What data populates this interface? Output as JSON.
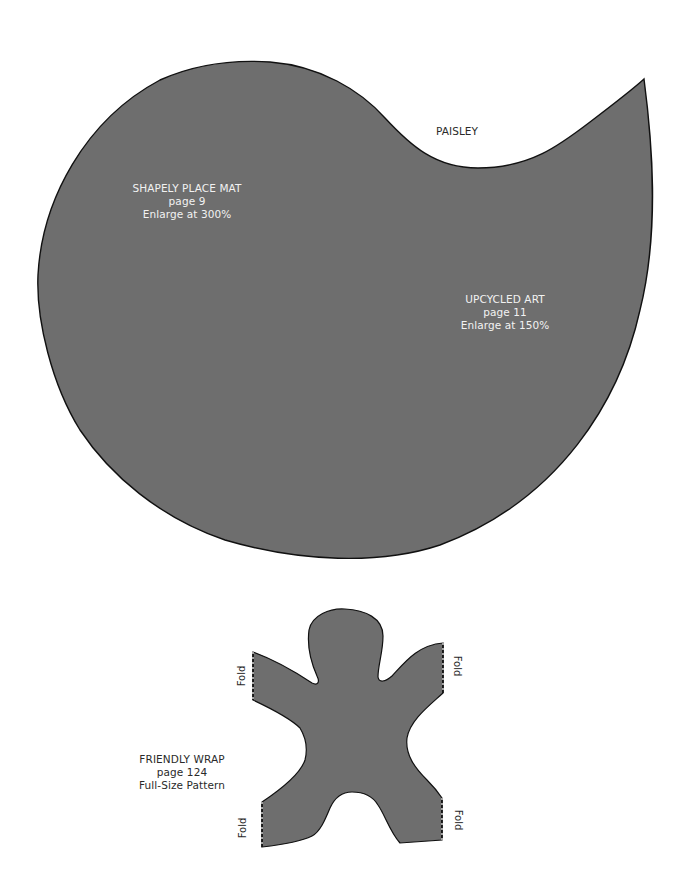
{
  "page": {
    "background": "#ffffff",
    "fill_color": "#6e6e6e",
    "outline_color": "#111111"
  },
  "paisley": {
    "shape_label": "PAISLEY",
    "patterns": [
      {
        "title": "SHAPELY PLACE MAT",
        "page": "page 9",
        "instruction": "Enlarge at 300%"
      },
      {
        "title": "UPCYCLED ART",
        "page": "page 11",
        "instruction": "Enlarge at 150%"
      }
    ]
  },
  "friendly_wrap": {
    "title": "FRIENDLY WRAP",
    "page": "page 124",
    "instruction": "Full-Size Pattern",
    "fold_labels": [
      "Fold",
      "Fold",
      "Fold",
      "Fold"
    ]
  }
}
